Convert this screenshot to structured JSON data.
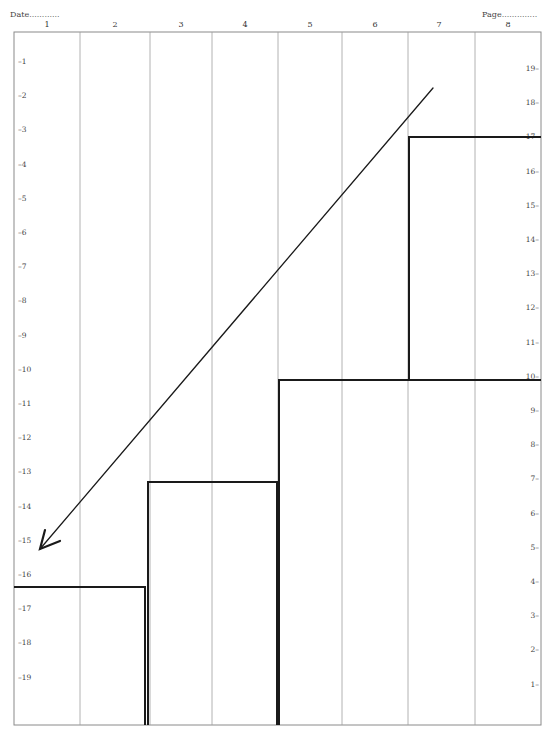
{
  "header": {
    "date_label": "Date............",
    "page_label": "Page.............."
  },
  "columns": [
    "1",
    "2",
    "3",
    "4",
    "5",
    "6",
    "7",
    "8"
  ],
  "left_scale": [
    "–1",
    "–2",
    "–3",
    "–4",
    "–5",
    "–6",
    "–7",
    "–8",
    "–9",
    "–10",
    "–11",
    "–12",
    "–13",
    "–14",
    "–15",
    "–16",
    "–17",
    "–18",
    "–19"
  ],
  "right_scale": [
    "19–",
    "18–",
    "17–",
    "16–",
    "15–",
    "14–",
    "13–",
    "12–",
    "11–",
    "10–",
    "9–",
    "8–",
    "7–",
    "6–",
    "5–",
    "4–",
    "3–",
    "2–",
    "1–"
  ],
  "colors": {
    "grid": "#9a9a9a",
    "ink": "#1a1a1a",
    "paper": "#ffffff"
  },
  "drawing": {
    "staircase": "stepped line rising from level 4 (cols 1-2) to 7 (cols 3-4) to 10 (cols 5-6) to 17 (cols 7-8)",
    "arrow": "diagonal arrow from upper right (col 7, ~level 18.5) pointing down-left to col 1, ~level 15"
  }
}
